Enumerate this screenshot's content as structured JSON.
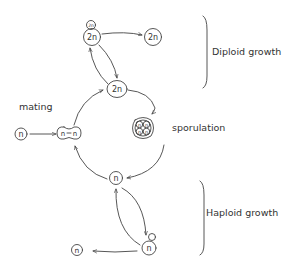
{
  "diagram": {
    "stroke_color": "#444444",
    "labels": {
      "mating": "mating",
      "sporulation": "sporulation",
      "diploid_growth": "Diploid growth",
      "haploid_growth": "Haploid growth"
    },
    "cells": {
      "diploid_budding": "2n",
      "diploid_bud": "2n",
      "diploid_daughter": "2n",
      "diploid_main": "2n",
      "haploid_mating": "n",
      "zygote_left": "n",
      "zygote_right": "n",
      "tetrad_spore_1": "n",
      "tetrad_spore_2": "n",
      "tetrad_spore_3": "n",
      "tetrad_spore_4": "n",
      "haploid_main": "n",
      "haploid_budding": "n",
      "haploid_released": "n"
    }
  }
}
